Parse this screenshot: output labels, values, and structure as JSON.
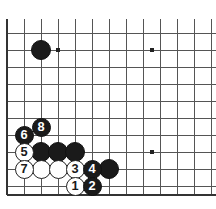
{
  "diagram": {
    "kind": "go-board-joseki-diagram",
    "board_size": 19,
    "view": {
      "left_px": 7,
      "top_px": 33,
      "spacing_px": 17,
      "cols_visible": 12,
      "rows_visible": 10,
      "right_edge_px": 211,
      "bottom_edge_px": 195,
      "line_color": "#555555",
      "edge_color": "#333333",
      "background": "#ffffff"
    },
    "star_points": [
      {
        "name": "star-point-upper-left",
        "x": 58,
        "y": 50
      },
      {
        "name": "star-point-upper-right",
        "x": 152,
        "y": 50
      },
      {
        "name": "star-point-lower-right",
        "x": 152,
        "y": 152
      }
    ],
    "stones": [
      {
        "id": "black-corner-stone",
        "color": "black",
        "x": 41,
        "y": 50,
        "r": 10,
        "label": ""
      },
      {
        "id": "black-move-8",
        "color": "black",
        "x": 41,
        "y": 127,
        "r": 9.5,
        "label": "8"
      },
      {
        "id": "black-move-6",
        "color": "black",
        "x": 24,
        "y": 135,
        "r": 9.5,
        "label": "6"
      },
      {
        "id": "white-move-5",
        "color": "white",
        "x": 24,
        "y": 152,
        "r": 9.5,
        "label": "5"
      },
      {
        "id": "black-stone-a",
        "color": "black",
        "x": 41,
        "y": 152,
        "r": 10,
        "label": ""
      },
      {
        "id": "black-stone-b",
        "color": "black",
        "x": 58,
        "y": 152,
        "r": 10,
        "label": ""
      },
      {
        "id": "black-stone-c",
        "color": "black",
        "x": 75,
        "y": 152,
        "r": 10,
        "label": ""
      },
      {
        "id": "white-move-7",
        "color": "white",
        "x": 24,
        "y": 169,
        "r": 9.5,
        "label": "7"
      },
      {
        "id": "white-stone-d",
        "color": "white",
        "x": 41,
        "y": 169,
        "r": 9.5,
        "label": ""
      },
      {
        "id": "white-stone-e",
        "color": "white",
        "x": 58,
        "y": 169,
        "r": 9.5,
        "label": ""
      },
      {
        "id": "white-move-3",
        "color": "white",
        "x": 75,
        "y": 169,
        "r": 9.5,
        "label": "3"
      },
      {
        "id": "black-move-4",
        "color": "black",
        "x": 92,
        "y": 169,
        "r": 9.5,
        "label": "4"
      },
      {
        "id": "black-stone-f",
        "color": "black",
        "x": 109,
        "y": 169,
        "r": 10,
        "label": ""
      },
      {
        "id": "white-move-1",
        "color": "white",
        "x": 75,
        "y": 186,
        "r": 9.5,
        "label": "1"
      },
      {
        "id": "black-move-2",
        "color": "black",
        "x": 92,
        "y": 186,
        "r": 9.5,
        "label": "2"
      }
    ],
    "move_labels": [
      "1",
      "2",
      "3",
      "4",
      "5",
      "6",
      "7",
      "8"
    ],
    "colors": {
      "black_stone": "#1a1a1a",
      "white_stone": "#ffffff",
      "stone_outline": "#232323",
      "grid": "#555555",
      "board_background": "#ffffff"
    }
  }
}
